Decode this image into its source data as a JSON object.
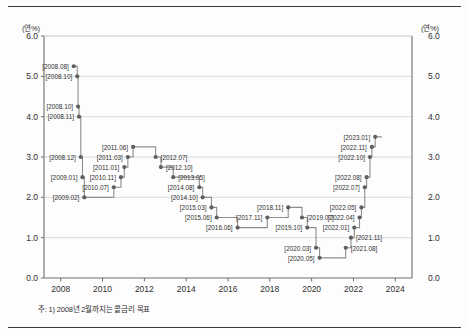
{
  "axis_unit_left": "(연%)",
  "axis_unit_right": "(연%)",
  "footnote": "주: 1) 2008년 2월까지는 콜금리 목표",
  "colors": {
    "line": "#8d8d8d",
    "marker": "#5f5f5f",
    "grid": "#cfcfcf",
    "axis": "#6e6e6e",
    "text": "#2f2f2f",
    "rule": "#3a3a3a",
    "background": "#fdfdfd"
  },
  "chart_data": {
    "type": "line",
    "title": "",
    "xlabel": "",
    "ylabel": "(연%)",
    "xlim": [
      2007.2,
      2024.8
    ],
    "ylim": [
      0.0,
      6.0
    ],
    "grid": true,
    "legend": null,
    "step": "post",
    "ytick_labels": [
      "6.0",
      "5.0",
      "4.0",
      "3.0",
      "2.0",
      "1.0",
      "0.0"
    ],
    "yticks": [
      6.0,
      5.0,
      4.0,
      3.0,
      2.0,
      1.0,
      0.0
    ],
    "xtick_labels": [
      "2008",
      "2010",
      "2012",
      "2014",
      "2016",
      "2018",
      "2020",
      "2022",
      "2024"
    ],
    "xticks": [
      2008,
      2010,
      2012,
      2014,
      2016,
      2018,
      2020,
      2022,
      2024
    ],
    "points": [
      {
        "label": "[2008.08]",
        "x": 2008.625,
        "y": 5.25,
        "side": "left"
      },
      {
        "label": "[2008.10]",
        "x": 2008.79,
        "y": 5.0,
        "side": "left"
      },
      {
        "label": "[2008.10]",
        "x": 2008.83,
        "y": 4.25,
        "side": "left"
      },
      {
        "label": "[2008.11]",
        "x": 2008.875,
        "y": 4.0,
        "side": "left"
      },
      {
        "label": "[2008.12]",
        "x": 2008.96,
        "y": 3.0,
        "side": "left"
      },
      {
        "label": "[2009.01]",
        "x": 2009.04,
        "y": 2.5,
        "side": "left"
      },
      {
        "label": "[2009.02]",
        "x": 2009.13,
        "y": 2.0,
        "side": "left"
      },
      {
        "label": "[2010.07]",
        "x": 2010.54,
        "y": 2.25,
        "side": "left"
      },
      {
        "label": "[2010.11]",
        "x": 2010.88,
        "y": 2.5,
        "side": "left"
      },
      {
        "label": "[2011.01]",
        "x": 2011.04,
        "y": 2.75,
        "side": "left"
      },
      {
        "label": "[2011.03]",
        "x": 2011.21,
        "y": 3.0,
        "side": "left"
      },
      {
        "label": "[2011.06]",
        "x": 2011.46,
        "y": 3.25,
        "side": "left"
      },
      {
        "label": "[2012.07]",
        "x": 2012.54,
        "y": 3.0,
        "side": "right"
      },
      {
        "label": "[2012.10]",
        "x": 2012.79,
        "y": 2.75,
        "side": "right"
      },
      {
        "label": "[2013.05]",
        "x": 2013.38,
        "y": 2.5,
        "side": "right"
      },
      {
        "label": "[2014.08]",
        "x": 2014.63,
        "y": 2.25,
        "side": "left"
      },
      {
        "label": "[2014.10]",
        "x": 2014.79,
        "y": 2.0,
        "side": "left"
      },
      {
        "label": "[2015.03]",
        "x": 2015.21,
        "y": 1.75,
        "side": "left"
      },
      {
        "label": "[2015.06]",
        "x": 2015.46,
        "y": 1.5,
        "side": "left"
      },
      {
        "label": "[2016.06]",
        "x": 2016.46,
        "y": 1.25,
        "side": "left"
      },
      {
        "label": "[2017.11]",
        "x": 2017.88,
        "y": 1.5,
        "side": "left"
      },
      {
        "label": "[2018.11]",
        "x": 2018.88,
        "y": 1.75,
        "side": "left"
      },
      {
        "label": "[2019.07]",
        "x": 2019.54,
        "y": 1.5,
        "side": "right"
      },
      {
        "label": "[2019.10]",
        "x": 2019.79,
        "y": 1.25,
        "side": "left"
      },
      {
        "label": "[2020.03]",
        "x": 2020.21,
        "y": 0.75,
        "side": "left"
      },
      {
        "label": "[2020.05]",
        "x": 2020.38,
        "y": 0.5,
        "side": "left"
      },
      {
        "label": "[2021.08]",
        "x": 2021.63,
        "y": 0.75,
        "side": "right"
      },
      {
        "label": "[2021.11]",
        "x": 2021.88,
        "y": 1.0,
        "side": "right"
      },
      {
        "label": "[2022.01]",
        "x": 2022.04,
        "y": 1.25,
        "side": "left"
      },
      {
        "label": "[2022.04]",
        "x": 2022.29,
        "y": 1.5,
        "side": "left"
      },
      {
        "label": "[2022.05]",
        "x": 2022.38,
        "y": 1.75,
        "side": "left"
      },
      {
        "label": "[2022.07]",
        "x": 2022.54,
        "y": 2.25,
        "side": "left"
      },
      {
        "label": "[2022.08]",
        "x": 2022.63,
        "y": 2.5,
        "side": "left"
      },
      {
        "label": "[2022.10]",
        "x": 2022.79,
        "y": 3.0,
        "side": "left"
      },
      {
        "label": "[2022.11]",
        "x": 2022.88,
        "y": 3.25,
        "side": "left"
      },
      {
        "label": "[2023.01]",
        "x": 2023.04,
        "y": 3.5,
        "side": "left"
      }
    ]
  }
}
